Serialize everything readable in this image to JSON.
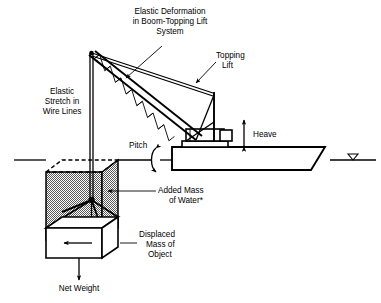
{
  "figure": {
    "background_color": "#ffffff",
    "line_color": "#000000",
    "shade_color": "#b3b3b3",
    "width": 381,
    "height": 303
  },
  "labels": {
    "elastic_deformation": {
      "lines": [
        "Elastic Deformation",
        "in Boom-Topping Lift",
        "System"
      ],
      "anchor": "middle",
      "x": 170,
      "y": 14
    },
    "topping_lift": {
      "lines": [
        "Topping",
        "Lift"
      ],
      "anchor": "start",
      "x": 216,
      "y": 58
    },
    "elastic_stretch": {
      "lines": [
        "Elastic",
        "Stretch in",
        "Wire Lines"
      ],
      "anchor": "middle",
      "x": 62,
      "y": 94
    },
    "pitch": {
      "lines": [
        "Pitch"
      ],
      "anchor": "start",
      "x": 129,
      "y": 144
    },
    "heave": {
      "lines": [
        "Heave"
      ],
      "anchor": "start",
      "x": 253,
      "y": 135
    },
    "added_mass": {
      "lines": [
        "Added Mass",
        "of Water*"
      ],
      "anchor": "start",
      "x": 158,
      "y": 193
    },
    "displaced_mass": {
      "lines": [
        "Displaced",
        "Mass of",
        "Object"
      ],
      "anchor": "start",
      "x": 139,
      "y": 235
    },
    "net_weight": {
      "lines": [
        "Net Weight"
      ],
      "anchor": "middle",
      "x": 79,
      "y": 289
    }
  },
  "parts": {
    "boom": "lattice-boom-truss",
    "mast": "crane-mast",
    "barge": "crane-barge-hull",
    "crane_house": "crane-machinery-house",
    "hoist_wire": "hoist-wire-lines",
    "rigging": "four-leg-sling-rigging",
    "submerged_object": "shaded-added-mass-volume",
    "object_body": "white-displaced-object-box",
    "waterline_left": "waterline-left-segment",
    "waterline_right": "waterline-right-segment",
    "water_symbol": "water-surface-triangle-symbol",
    "heave_arrow": "heave-double-arrow",
    "pitch_arrow": "pitch-rotation-arrow",
    "net_weight_arrow": "net-weight-down-arrow",
    "buoyancy_arrow": "displaced-mass-arrow"
  }
}
